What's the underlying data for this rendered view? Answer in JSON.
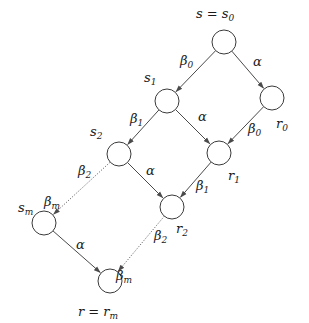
{
  "diagram": {
    "type": "lattice-graph",
    "nodes": [
      {
        "id": "s0",
        "label": "s = s",
        "sub": "0",
        "x": 224,
        "y": 42,
        "lx": 196,
        "ly": 18
      },
      {
        "id": "s1",
        "label": "s",
        "sub": "1",
        "x": 167,
        "y": 101,
        "lx": 144,
        "ly": 82
      },
      {
        "id": "r0",
        "label": "r",
        "sub": "0",
        "x": 272,
        "y": 98,
        "lx": 276,
        "ly": 128
      },
      {
        "id": "s2",
        "label": "s",
        "sub": "2",
        "x": 119,
        "y": 154,
        "lx": 90,
        "ly": 136
      },
      {
        "id": "r1",
        "label": "r",
        "sub": "1",
        "x": 219,
        "y": 153,
        "lx": 228,
        "ly": 180
      },
      {
        "id": "r2",
        "label": "r",
        "sub": "2",
        "x": 172,
        "y": 207,
        "lx": 176,
        "ly": 233
      },
      {
        "id": "sm",
        "label": "s",
        "sub": "m",
        "x": 44,
        "y": 223,
        "lx": 18,
        "ly": 212
      },
      {
        "id": "rm",
        "label": "r = r",
        "sub": "m",
        "x": 110,
        "y": 281,
        "lx": 78,
        "ly": 316
      }
    ],
    "edges": [
      {
        "from": "s0",
        "to": "s1",
        "label": "β",
        "sub": "0",
        "style": "solid",
        "lx": 180,
        "ly": 65
      },
      {
        "from": "s0",
        "to": "r0",
        "label": "α",
        "style": "solid",
        "lx": 253,
        "ly": 66
      },
      {
        "from": "s1",
        "to": "s2",
        "label": "β",
        "sub": "1",
        "style": "solid",
        "lx": 130,
        "ly": 123
      },
      {
        "from": "s1",
        "to": "r1",
        "label": "α",
        "style": "solid",
        "lx": 198,
        "ly": 121
      },
      {
        "from": "r0",
        "to": "r1",
        "label": "β",
        "sub": "0",
        "style": "solid",
        "lx": 248,
        "ly": 133
      },
      {
        "from": "s2",
        "to": "r2",
        "label": "α",
        "style": "solid",
        "lx": 146,
        "ly": 175
      },
      {
        "from": "r1",
        "to": "r2",
        "label": "β",
        "sub": "1",
        "style": "solid",
        "lx": 196,
        "ly": 190
      },
      {
        "from": "s2",
        "to": "sm",
        "label": "β",
        "sub": "2",
        "style": "dotted",
        "lx": 78,
        "ly": 175
      },
      {
        "from": "sm",
        "to": "rm",
        "label": "α",
        "style": "solid",
        "lx": 76,
        "ly": 249
      },
      {
        "from": "r2",
        "to": "rm",
        "label": "β",
        "sub": "2",
        "style": "dotted",
        "lx": 154,
        "ly": 240
      },
      {
        "from": "sm",
        "extra_label": true,
        "label": "β",
        "sub": "m",
        "lx": 44,
        "ly": 205
      }
    ],
    "extra_labels": [
      {
        "label": "β",
        "sub": "m",
        "x": 44,
        "y": 206
      },
      {
        "label": "β",
        "sub": "m",
        "x": 116,
        "y": 280
      }
    ],
    "node_radius": 12
  }
}
